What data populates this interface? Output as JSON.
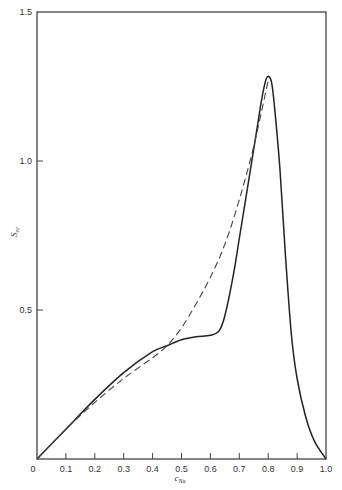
{
  "chart_data": {
    "type": "line",
    "title": "",
    "xlabel": "c",
    "xlabel_sub": "Na",
    "ylabel": "S",
    "ylabel_sub": "ee",
    "xlim": [
      0,
      1.0
    ],
    "ylim": [
      0,
      1.5
    ],
    "grid": false,
    "legend": null,
    "x_ticks": [
      "0",
      "0.1",
      "0.2",
      "0.3",
      "0.4",
      "0.5",
      "0.6",
      "0.7",
      "0.8",
      "0.9",
      "1.0"
    ],
    "y_ticks": [
      "0.5",
      "1.0",
      "1.5"
    ],
    "series": [
      {
        "name": "solid",
        "style": "solid",
        "x": [
          0,
          0.1,
          0.2,
          0.3,
          0.4,
          0.45,
          0.5,
          0.55,
          0.6,
          0.63,
          0.65,
          0.68,
          0.7,
          0.73,
          0.76,
          0.78,
          0.795,
          0.81,
          0.82,
          0.84,
          0.86,
          0.88,
          0.9,
          0.93,
          0.96,
          1.0
        ],
        "y": [
          0,
          0.1,
          0.2,
          0.29,
          0.36,
          0.38,
          0.4,
          0.41,
          0.415,
          0.43,
          0.48,
          0.62,
          0.74,
          0.92,
          1.1,
          1.22,
          1.28,
          1.27,
          1.2,
          0.98,
          0.68,
          0.42,
          0.27,
          0.14,
          0.06,
          0
        ]
      },
      {
        "name": "dashed",
        "style": "dashed",
        "x": [
          0,
          0.1,
          0.2,
          0.3,
          0.4,
          0.45,
          0.5,
          0.55,
          0.6,
          0.65,
          0.7,
          0.75,
          0.8
        ],
        "y": [
          0,
          0.1,
          0.19,
          0.27,
          0.34,
          0.38,
          0.44,
          0.52,
          0.61,
          0.72,
          0.87,
          1.05,
          1.27
        ]
      }
    ]
  }
}
